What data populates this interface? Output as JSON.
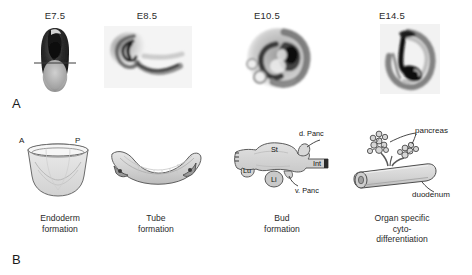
{
  "figure": {
    "panels": [
      {
        "letter": "A",
        "name": "embryo-micrographs",
        "stages": [
          {
            "label": "E7.5",
            "name": "stage-e7-5"
          },
          {
            "label": "E8.5",
            "name": "stage-e8-5"
          },
          {
            "label": "E10.5",
            "name": "stage-e10-5"
          },
          {
            "label": "E14.5",
            "name": "stage-e14-5"
          }
        ]
      },
      {
        "letter": "B",
        "name": "schematic-diagrams",
        "steps": [
          {
            "name": "endoderm-formation",
            "caption_line1": "Endoderm",
            "caption_line2": "formation",
            "annotations": [
              {
                "text": "A",
                "name": "anterior-label"
              },
              {
                "text": "P",
                "name": "posterior-label"
              }
            ]
          },
          {
            "name": "tube-formation",
            "caption_line1": "Tube",
            "caption_line2": "formation",
            "annotations": []
          },
          {
            "name": "bud-formation",
            "caption_line1": "Bud",
            "caption_line2": "formation",
            "annotations": [
              {
                "text": "d. Panc",
                "name": "dorsal-pancreas-label"
              },
              {
                "text": "St",
                "name": "stomach-label"
              },
              {
                "text": "Int",
                "name": "intestine-label"
              },
              {
                "text": "Lu",
                "name": "lung-label"
              },
              {
                "text": "Li",
                "name": "liver-label"
              },
              {
                "text": "v. Panc",
                "name": "ventral-pancreas-label"
              }
            ]
          },
          {
            "name": "cytodifferentiation",
            "caption_line1": "Organ specific",
            "caption_line2": "cyto-",
            "caption_line3": "differentiation",
            "annotations": [
              {
                "text": "pancreas",
                "name": "pancreas-label"
              },
              {
                "text": "duodenum",
                "name": "duodenum-label"
              }
            ]
          }
        ]
      }
    ]
  },
  "colors": {
    "background": "#ffffff",
    "ink": "#231f20",
    "schematic_fill": "#d6d6d6",
    "schematic_stroke": "#4a4a4a",
    "micro_dark": "#1c1c1c",
    "micro_mid": "#8a8a8a",
    "micro_light": "#d8d8d8"
  }
}
